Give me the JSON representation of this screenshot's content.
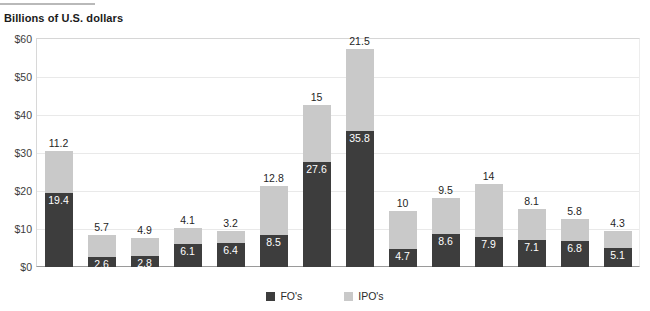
{
  "chart_data": {
    "type": "bar",
    "subtype": "stacked-column",
    "title": "Billions of U.S. dollars",
    "xlabel": "",
    "ylabel": "Billions of U.S. dollars",
    "ylim": [
      0,
      60
    ],
    "ytick_values": [
      0,
      10,
      20,
      30,
      40,
      50,
      60
    ],
    "ytick_labels": [
      "$0",
      "$10",
      "$20",
      "$30",
      "$40",
      "$50",
      "$60"
    ],
    "grid": true,
    "legend_position": "bottom-center",
    "categories": [
      "2000",
      "2001",
      "2002",
      "2003",
      "2004",
      "2005",
      "2006",
      "2007",
      "2008",
      "2009",
      "2010",
      "2011",
      "2012",
      "2013"
    ],
    "series": [
      {
        "name": "FO's",
        "color": "#3d3d3d",
        "values": [
          19.4,
          2.6,
          2.8,
          6.1,
          6.4,
          8.5,
          27.6,
          35.8,
          4.7,
          8.6,
          7.9,
          7.1,
          6.8,
          5.1
        ],
        "labels": [
          "19.4",
          "2.6",
          "2.8",
          "6.1",
          "6.4",
          "8.5",
          "27.6",
          "35.8",
          "4.7",
          "8.6",
          "7.9",
          "7.1",
          "6.8",
          "5.1"
        ]
      },
      {
        "name": "IPO's",
        "color": "#c9c9c9",
        "values": [
          11.2,
          5.7,
          4.9,
          4.1,
          3.2,
          12.8,
          15,
          21.5,
          10,
          9.5,
          14,
          8.1,
          5.8,
          4.3
        ],
        "labels": [
          "11.2",
          "5.7",
          "4.9",
          "4.1",
          "3.2",
          "12.8",
          "15",
          "21.5",
          "10",
          "9.5",
          "14",
          "8.1",
          "5.8",
          "4.3"
        ]
      }
    ]
  },
  "legend": {
    "items": [
      {
        "label": "FO's",
        "color": "#3d3d3d"
      },
      {
        "label": "IPO's",
        "color": "#c9c9c9"
      }
    ]
  }
}
